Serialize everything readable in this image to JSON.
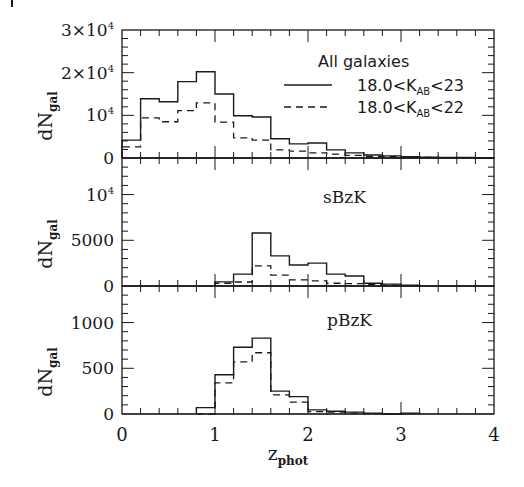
{
  "figure": {
    "width": 524,
    "height": 487,
    "plot_left": 122,
    "plot_right": 494,
    "ink_color": "#1a1a1a",
    "background": "#ffffff"
  },
  "chart_data": [
    {
      "type": "histogram",
      "panel": "top",
      "label": "",
      "legend_title": "All galaxies",
      "ylabel": "dN_gal",
      "ylim": [
        0,
        30000
      ],
      "yticks": [
        {
          "value": 0,
          "label": "0"
        },
        {
          "value": 10000,
          "label": "10^4"
        },
        {
          "value": 20000,
          "label": "2×10^4"
        },
        {
          "value": 30000,
          "label": "3×10^4"
        }
      ],
      "y_minor_step": 2000,
      "xlim": [
        0,
        4
      ],
      "bin_edges": [
        0.0,
        0.2,
        0.4,
        0.6,
        0.8,
        1.0,
        1.2,
        1.4,
        1.6,
        1.8,
        2.0,
        2.2,
        2.4,
        2.6,
        2.8,
        3.0,
        3.2,
        3.4,
        3.6,
        3.8,
        4.0
      ],
      "series": [
        {
          "name": "18.0<K_AB<23",
          "style": "solid",
          "values": [
            4200,
            13900,
            13200,
            17900,
            20200,
            15000,
            9900,
            9600,
            4500,
            3300,
            3500,
            1900,
            1200,
            700,
            500,
            300,
            200,
            150,
            100,
            50
          ]
        },
        {
          "name": "18.0<K_AB<22",
          "style": "dashed",
          "values": [
            2600,
            9400,
            8500,
            11100,
            12900,
            8400,
            4700,
            4200,
            1900,
            1600,
            1200,
            900,
            600,
            400,
            300,
            200,
            150,
            100,
            50,
            30
          ]
        }
      ]
    },
    {
      "type": "histogram",
      "panel": "middle",
      "label": "sBzK",
      "ylabel": "dN_gal",
      "ylim": [
        0,
        14000
      ],
      "yticks": [
        {
          "value": 0,
          "label": "0"
        },
        {
          "value": 5000,
          "label": "5000"
        },
        {
          "value": 10000,
          "label": "10^4"
        }
      ],
      "y_minor_step": 1000,
      "xlim": [
        0,
        4
      ],
      "bin_edges": [
        1.0,
        1.2,
        1.4,
        1.6,
        1.8,
        2.0,
        2.2,
        2.4,
        2.6,
        2.8,
        3.0,
        3.2
      ],
      "series": [
        {
          "name": "18.0<K_AB<23",
          "style": "solid",
          "values": [
            450,
            1300,
            5800,
            3300,
            2300,
            2500,
            1300,
            1100,
            300,
            200,
            100
          ]
        },
        {
          "name": "18.0<K_AB<22",
          "style": "dashed",
          "values": [
            300,
            440,
            2200,
            1200,
            660,
            550,
            300,
            250,
            150,
            100,
            50
          ]
        }
      ]
    },
    {
      "type": "histogram",
      "panel": "bottom",
      "label": "pBzK",
      "ylabel": "dN_gal",
      "xlabel": "z_phot",
      "ylim": [
        0,
        1400
      ],
      "yticks": [
        {
          "value": 0,
          "label": "0"
        },
        {
          "value": 500,
          "label": "500"
        },
        {
          "value": 1000,
          "label": "1000"
        }
      ],
      "y_minor_step": 100,
      "xlim": [
        0,
        4
      ],
      "xticks": [
        {
          "value": 0,
          "label": "0"
        },
        {
          "value": 1,
          "label": "1"
        },
        {
          "value": 2,
          "label": "2"
        },
        {
          "value": 3,
          "label": "3"
        },
        {
          "value": 4,
          "label": "4"
        }
      ],
      "x_minor_step": 0.2,
      "bin_edges": [
        0.8,
        1.0,
        1.2,
        1.4,
        1.6,
        1.8,
        2.0,
        2.2,
        2.4,
        2.6,
        2.8,
        3.0,
        3.2
      ],
      "series": [
        {
          "name": "18.0<K_AB<23",
          "style": "solid",
          "values": [
            70,
            430,
            730,
            830,
            250,
            190,
            45,
            30,
            20,
            10,
            0,
            10
          ]
        },
        {
          "name": "18.0<K_AB<22",
          "style": "dashed",
          "values": [
            0,
            340,
            570,
            670,
            210,
            130,
            25,
            20,
            10,
            5,
            0,
            5
          ]
        }
      ]
    }
  ],
  "legend": {
    "title": "All galaxies",
    "entries": [
      {
        "style": "solid",
        "prefix": "18.0<K",
        "sub": "AB",
        "suffix": "<23"
      },
      {
        "style": "dashed",
        "prefix": "18.0<K",
        "sub": "AB",
        "suffix": "<22"
      }
    ]
  },
  "axis_labels": {
    "y_main": "dN",
    "y_sub": "gal",
    "x_main": "z",
    "x_sub": "phot"
  },
  "panel_labels": {
    "middle": "sBzK",
    "bottom": "pBzK"
  }
}
